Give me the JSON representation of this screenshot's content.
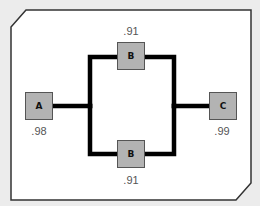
{
  "diagram": {
    "type": "reliability-block-diagram",
    "nodes": [
      {
        "id": "A",
        "label": "A",
        "reliability": ".98"
      },
      {
        "id": "B1",
        "label": "B",
        "reliability": ".91"
      },
      {
        "id": "B2",
        "label": "B",
        "reliability": ".91"
      },
      {
        "id": "C",
        "label": "C",
        "reliability": ".99"
      }
    ],
    "edges": [
      {
        "from": "A",
        "to": "B1"
      },
      {
        "from": "A",
        "to": "B2"
      },
      {
        "from": "B1",
        "to": "C"
      },
      {
        "from": "B2",
        "to": "C"
      }
    ],
    "colors": {
      "background": "#ececec",
      "panel": "#ffffff",
      "node_fill": "#b3b3b3",
      "node_border": "#555555",
      "connector": "#000000",
      "label": "#555555"
    }
  }
}
